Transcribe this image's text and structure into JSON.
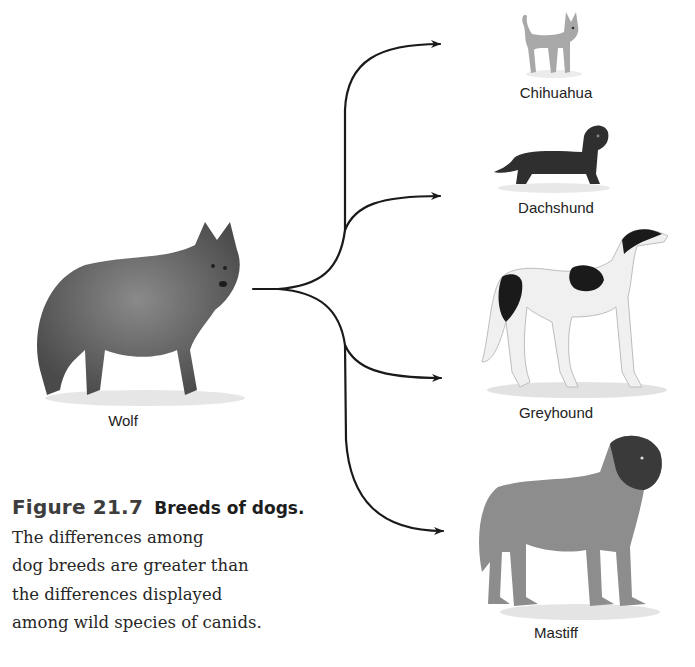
{
  "figure": {
    "number": "Figure 21.7",
    "title": "Breeds of dogs.",
    "caption_lines": [
      "The differences among",
      "dog breeds are greater than",
      "the differences displayed",
      "among wild species of canids."
    ]
  },
  "source": {
    "label": "Wolf",
    "icon": "wolf-illustration"
  },
  "breeds": [
    {
      "label": "Chihuahua",
      "icon": "chihuahua-illustration"
    },
    {
      "label": "Dachshund",
      "icon": "dachshund-illustration"
    },
    {
      "label": "Greyhound",
      "icon": "greyhound-illustration"
    },
    {
      "label": "Mastiff",
      "icon": "mastiff-illustration"
    }
  ],
  "colors": {
    "arrow": "#1a1a1a",
    "text": "#222222",
    "figure_number": "#3d3d3d"
  }
}
